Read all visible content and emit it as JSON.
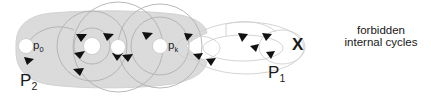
{
  "figure": {
    "labels": {
      "p0": "p",
      "p0_sub": "0",
      "pk": "p",
      "pk_sub": "k",
      "region_outer": "P",
      "region_outer_sub": "2",
      "region_inner": "P",
      "region_inner_sub": "1",
      "x_mark": "X",
      "note_line1": "forbidden",
      "note_line2": "internal cycles"
    },
    "colors": {
      "region_fill": "#dcdcdc",
      "region_fill_edge": "#d2d2d2",
      "background": "#ffffff",
      "curve_stroke": "#b4b4b4",
      "curve_stroke_light": "#d8d8d8",
      "node_fill": "#ffffff",
      "node_stroke": "#c8c8c8",
      "arrow_fill": "#111111",
      "text": "#1b1b1b"
    },
    "nodes": [
      {
        "name": "p0",
        "cx": 26,
        "cy": 46,
        "r": 7.5
      },
      {
        "name": "node-2",
        "cx": 92,
        "cy": 46,
        "r": 8.5
      },
      {
        "name": "node-3",
        "cx": 118,
        "cy": 47,
        "r": 7.5
      },
      {
        "name": "pk",
        "cx": 160,
        "cy": 46,
        "r": 7.5
      }
    ]
  }
}
